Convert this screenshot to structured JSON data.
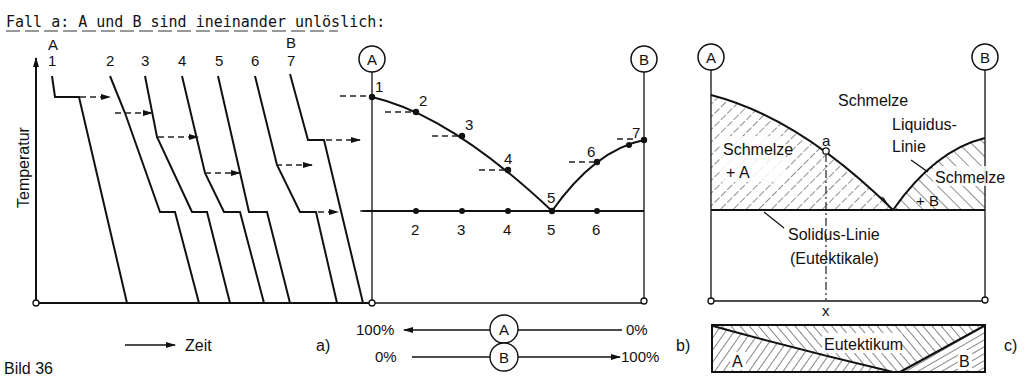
{
  "title": "Fall a: A und B sind ineinander unlöslich:",
  "figure_caption": "Bild 36",
  "panel_a": {
    "label": "a)",
    "y_axis_label": "Temperatur",
    "x_axis_label": "Zeit",
    "top_labels": {
      "left": "A",
      "right": "B"
    },
    "curve_numbers": [
      "1",
      "2",
      "3",
      "4",
      "5",
      "6",
      "7"
    ]
  },
  "panel_b": {
    "label": "b)",
    "circle_left": "A",
    "circle_right": "B",
    "liquidus_point_labels": [
      "1",
      "2",
      "3",
      "4",
      "5",
      "6",
      "7"
    ],
    "eutectic_line_labels": [
      "2",
      "3",
      "4",
      "5",
      "6"
    ],
    "scale": {
      "row_a": {
        "circle": "A",
        "left": "100%",
        "right": "0%"
      },
      "row_b": {
        "circle": "B",
        "left": "0%",
        "right": "100%"
      }
    }
  },
  "panel_c": {
    "label": "c)",
    "circle_left": "A",
    "circle_right": "B",
    "region_melt": "Schmelze",
    "region_left_line1": "Schmelze",
    "region_left_line2": "+ A",
    "region_right_line1": "Schmelze",
    "region_right_line2": "+ B",
    "liquidus_line1": "Liquidus-",
    "liquidus_line2": "Linie",
    "solidus_line1": "Solidus-Linie",
    "solidus_line2": "(Eutektikale)",
    "point_a": "a",
    "composition_x": "x",
    "strip": {
      "left": "A",
      "center": "Eutektikum",
      "right": "B"
    }
  }
}
